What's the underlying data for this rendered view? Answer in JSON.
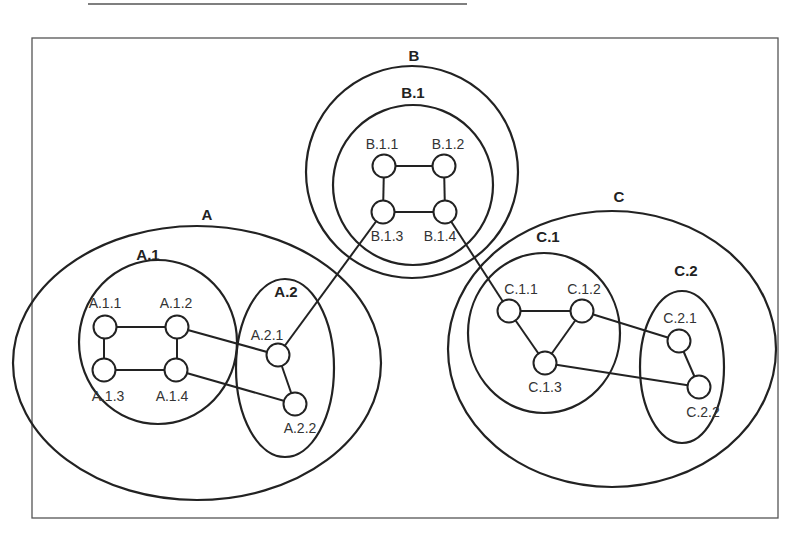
{
  "diagram": {
    "type": "hierarchical-cluster-graph",
    "clusters": [
      {
        "id": "A",
        "label": "A",
        "children": [
          {
            "id": "A.1",
            "label": "A.1",
            "nodes": [
              "A.1.1",
              "A.1.2",
              "A.1.3",
              "A.1.4"
            ]
          },
          {
            "id": "A.2",
            "label": "A.2",
            "nodes": [
              "A.2.1",
              "A.2.2"
            ]
          }
        ]
      },
      {
        "id": "B",
        "label": "B",
        "children": [
          {
            "id": "B.1",
            "label": "B.1",
            "nodes": [
              "B.1.1",
              "B.1.2",
              "B.1.3",
              "B.1.4"
            ]
          }
        ]
      },
      {
        "id": "C",
        "label": "C",
        "children": [
          {
            "id": "C.1",
            "label": "C.1",
            "nodes": [
              "C.1.1",
              "C.1.2",
              "C.1.3"
            ]
          },
          {
            "id": "C.2",
            "label": "C.2",
            "nodes": [
              "C.2.1",
              "C.2.2"
            ]
          }
        ]
      }
    ],
    "labels": {
      "A": "A",
      "A1": "A.1",
      "A2": "A.2",
      "B": "B",
      "B1": "B.1",
      "C": "C",
      "C1": "C.1",
      "C2": "C.2",
      "A11": "A.1.1",
      "A12": "A.1.2",
      "A13": "A.1.3",
      "A14": "A.1.4",
      "A21": "A.2.1",
      "A22": "A.2.2",
      "B11": "B.1.1",
      "B12": "B.1.2",
      "B13": "B.1.3",
      "B14": "B.1.4",
      "C11": "C.1.1",
      "C12": "C.1.2",
      "C13": "C.1.3",
      "C21": "C.2.1",
      "C22": "C.2.2"
    },
    "edges": [
      [
        "A.1.1",
        "A.1.2"
      ],
      [
        "A.1.1",
        "A.1.3"
      ],
      [
        "A.1.2",
        "A.1.4"
      ],
      [
        "A.1.3",
        "A.1.4"
      ],
      [
        "A.1.2",
        "A.2.1"
      ],
      [
        "A.1.4",
        "A.2.2"
      ],
      [
        "A.2.1",
        "A.2.2"
      ],
      [
        "A.2.1",
        "B.1.3"
      ],
      [
        "B.1.1",
        "B.1.2"
      ],
      [
        "B.1.1",
        "B.1.3"
      ],
      [
        "B.1.2",
        "B.1.4"
      ],
      [
        "B.1.3",
        "B.1.4"
      ],
      [
        "B.1.4",
        "C.1.1"
      ],
      [
        "C.1.1",
        "C.1.2"
      ],
      [
        "C.1.1",
        "C.1.3"
      ],
      [
        "C.1.2",
        "C.1.3"
      ],
      [
        "C.1.2",
        "C.2.1"
      ],
      [
        "C.1.3",
        "C.2.2"
      ],
      [
        "C.2.1",
        "C.2.2"
      ]
    ]
  }
}
